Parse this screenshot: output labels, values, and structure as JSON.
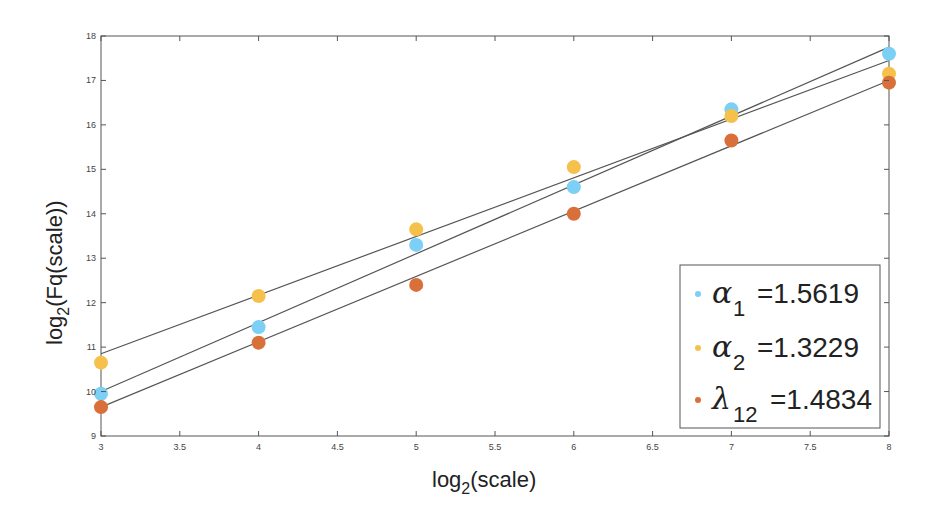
{
  "chart_data": {
    "type": "scatter",
    "title": "",
    "xlabel": "log2(scale)",
    "ylabel": "log2(Fq(scale))",
    "xlim": [
      3,
      8
    ],
    "ylim": [
      9,
      18
    ],
    "xticks": [
      3,
      3.5,
      4,
      4.5,
      5,
      5.5,
      6,
      6.5,
      7,
      7.5,
      8
    ],
    "xtick_labels": [
      "3",
      "3.5",
      "4",
      "4.5",
      "5",
      "5.5",
      "6",
      "6.5",
      "7",
      "7.5",
      "8"
    ],
    "yticks": [
      9,
      10,
      11,
      12,
      13,
      14,
      15,
      16,
      17,
      18
    ],
    "ytick_labels": [
      "9",
      "10",
      "11",
      "12",
      "13",
      "14",
      "15",
      "16",
      "17",
      "18"
    ],
    "grid": false,
    "legend_position": "lower right",
    "x": [
      3,
      4,
      5,
      6,
      7,
      8
    ],
    "series": [
      {
        "name": "α1 =1.5619",
        "greek": "α",
        "sub": "1",
        "value_text": "=1.5619",
        "slope": 1.5619,
        "color": "#7ccff5",
        "values": [
          9.95,
          11.45,
          13.3,
          14.6,
          16.35,
          17.6
        ],
        "fit_line": [
          10.0,
          17.75
        ]
      },
      {
        "name": "α2 =1.3229",
        "greek": "α",
        "sub": "2",
        "value_text": "=1.3229",
        "slope": 1.3229,
        "color": "#f5c14a",
        "values": [
          10.65,
          12.15,
          13.65,
          15.05,
          16.2,
          17.15
        ],
        "fit_line": [
          10.85,
          17.45
        ]
      },
      {
        "name": "λ12 =1.4834",
        "greek": "λ",
        "sub": "12",
        "value_text": "=1.4834",
        "slope": 1.4834,
        "color": "#d9703a",
        "values": [
          9.65,
          11.1,
          12.4,
          14.0,
          15.65,
          16.95
        ],
        "fit_line": [
          9.65,
          17.0
        ]
      }
    ],
    "fit_line_color": "#555555"
  },
  "axes": {
    "xlabel_main": "log",
    "xlabel_sub": "2",
    "xlabel_rest": "(scale)",
    "ylabel_main": "log",
    "ylabel_sub": "2",
    "ylabel_rest": "(Fq(scale))"
  }
}
